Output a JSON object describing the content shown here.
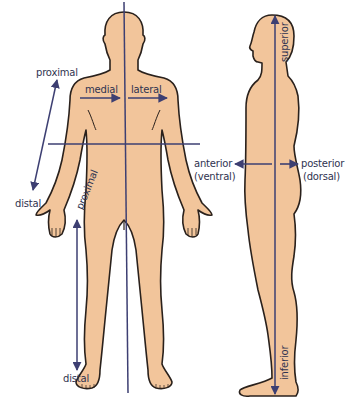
{
  "diagram": {
    "colors": {
      "skin": "#F2C59B",
      "outline": "#2a211c",
      "axis_line": "#3d3f72",
      "label_text": "#2f3350",
      "background": "#ffffff"
    },
    "figures": [
      {
        "id": "anterior-view",
        "description": "Front view of human body"
      },
      {
        "id": "lateral-view",
        "description": "Side (profile) view of human body"
      }
    ],
    "labels": {
      "arm_proximal": "proximal",
      "arm_distal": "distal",
      "medial": "medial",
      "lateral": "lateral",
      "leg_proximal": "proximal",
      "leg_distal": "distal",
      "anterior": "anterior",
      "ventral": "(ventral)",
      "posterior": "posterior",
      "dorsal": "(dorsal)",
      "superior": "superior",
      "inferior": "inferior"
    },
    "arrows": [
      {
        "id": "arm-proximal-distal",
        "from": "distal",
        "to": "proximal",
        "bidirectional": true
      },
      {
        "id": "medial-arrow",
        "direction": "toward midline"
      },
      {
        "id": "lateral-arrow",
        "direction": "away from midline"
      },
      {
        "id": "leg-proximal-distal",
        "bidirectional": true
      },
      {
        "id": "anterior-arrow",
        "direction": "front"
      },
      {
        "id": "posterior-arrow",
        "direction": "back"
      },
      {
        "id": "superior-inferior",
        "bidirectional": true
      }
    ]
  }
}
